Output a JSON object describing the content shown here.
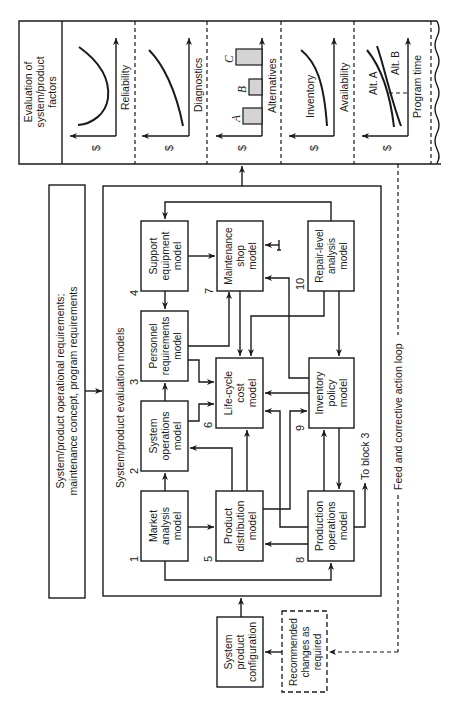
{
  "orientation": "rotated-90-ccw",
  "evaluation_panel": {
    "title_lines": [
      "Evaluation of",
      "system/product",
      "factors"
    ],
    "charts": [
      {
        "id": "reliability",
        "x_label": "Reliability",
        "y_label": "$",
        "curve": "u-shape"
      },
      {
        "id": "diagnostics",
        "x_label": "Diagnostics",
        "y_label": "$",
        "curve": "decreasing"
      },
      {
        "id": "alternatives",
        "x_label": "Alternatives",
        "y_label": "$",
        "bars": [
          "A",
          "B",
          "C"
        ]
      },
      {
        "id": "availability",
        "x_label": "Availability",
        "y_label": "$",
        "curve_label": "Inventory"
      },
      {
        "id": "program-time",
        "x_label": "Program time",
        "y_label": "$",
        "curve_labels": [
          "Alt. A",
          "Alt. B"
        ]
      }
    ]
  },
  "requirements_box": {
    "lines": [
      "System/product operational requirements;",
      "maintenance concept, program requirements"
    ]
  },
  "models_frame": {
    "title": "System/product evaluation models",
    "models": [
      {
        "num": "1",
        "lines": [
          "Market",
          "analysis",
          "model"
        ]
      },
      {
        "num": "2",
        "lines": [
          "System",
          "operations",
          "model"
        ]
      },
      {
        "num": "3",
        "lines": [
          "Personnel",
          "requirements",
          "model"
        ]
      },
      {
        "num": "4",
        "lines": [
          "Support",
          "equipment",
          "model"
        ]
      },
      {
        "num": "5",
        "lines": [
          "Product",
          "distribution",
          "model"
        ]
      },
      {
        "num": "6",
        "lines": [
          "Life-cycle",
          "cost",
          "model"
        ]
      },
      {
        "num": "7",
        "lines": [
          "Maintenance",
          "shop",
          "model"
        ]
      },
      {
        "num": "8",
        "lines": [
          "Production",
          "operations",
          "model"
        ]
      },
      {
        "num": "9",
        "lines": [
          "Inventory",
          "policy",
          "model"
        ]
      },
      {
        "num": "10",
        "lines": [
          "Repair-level",
          "analysis",
          "model"
        ]
      }
    ],
    "to_block_label": "To block 3"
  },
  "config_box": {
    "lines": [
      "System",
      "product",
      "configuration"
    ]
  },
  "recommended_box": {
    "lines": [
      "Recommended",
      "changes as",
      "required"
    ]
  },
  "feedback_loop_label": "Feed and corrective action loop"
}
